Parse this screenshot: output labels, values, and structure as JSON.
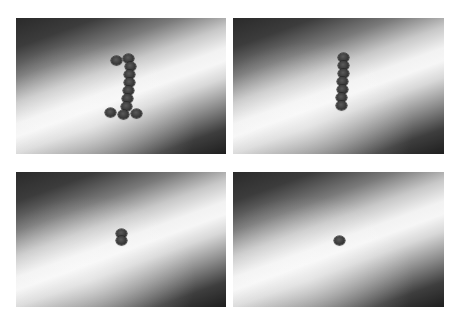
{
  "figure": {
    "panels": [
      {
        "id": "panel-1",
        "subject": "coins arranged in the shape of the numeral 1",
        "coin_count": 11
      },
      {
        "id": "panel-2",
        "subject": "coins arranged in a vertical line",
        "coin_count": 7
      },
      {
        "id": "panel-3",
        "subject": "two stacked coins",
        "coin_count": 2
      },
      {
        "id": "panel-4",
        "subject": "a single coin",
        "coin_count": 1
      }
    ]
  }
}
